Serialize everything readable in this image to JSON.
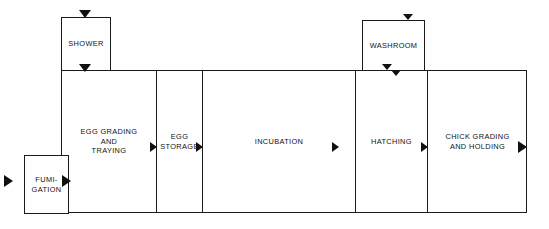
{
  "diagram": {
    "type": "process-flow",
    "line_color": "#1a1a1a",
    "arrow_color": "#111111",
    "background": "#ffffff"
  },
  "process_line": {
    "stages": [
      {
        "id": "egg-grading-and-traying",
        "label": "EGG GRADING\nAND\nTRAYING"
      },
      {
        "id": "egg-storage",
        "label": "EGG\nSTORAGE"
      },
      {
        "id": "incubation",
        "label": "INCUBATION"
      },
      {
        "id": "hatching",
        "label": "HATCHING"
      },
      {
        "id": "chick-grading-and-holding",
        "label": "CHICK GRADING\nAND HOLDING"
      }
    ]
  },
  "annex_rooms": [
    {
      "id": "shower",
      "label": "SHOWER"
    },
    {
      "id": "washroom",
      "label": "WASHROOM"
    },
    {
      "id": "fumigation",
      "label": "FUMI-\nGATION"
    }
  ],
  "arrows": [
    {
      "id": "entry-to-fumigation",
      "direction": "right"
    },
    {
      "id": "fumigation-to-egg-grading",
      "direction": "right"
    },
    {
      "id": "egg-grading-to-egg-storage",
      "direction": "right"
    },
    {
      "id": "egg-storage-to-incubation",
      "direction": "right"
    },
    {
      "id": "incubation-to-hatching",
      "direction": "right"
    },
    {
      "id": "hatching-to-chick-grading",
      "direction": "right"
    },
    {
      "id": "chick-grading-exit",
      "direction": "right"
    },
    {
      "id": "shower-entry",
      "direction": "down"
    },
    {
      "id": "shower-to-floor",
      "direction": "down"
    },
    {
      "id": "washroom-entry",
      "direction": "down"
    },
    {
      "id": "washroom-exit-a",
      "direction": "down"
    },
    {
      "id": "washroom-exit-b",
      "direction": "down"
    }
  ]
}
